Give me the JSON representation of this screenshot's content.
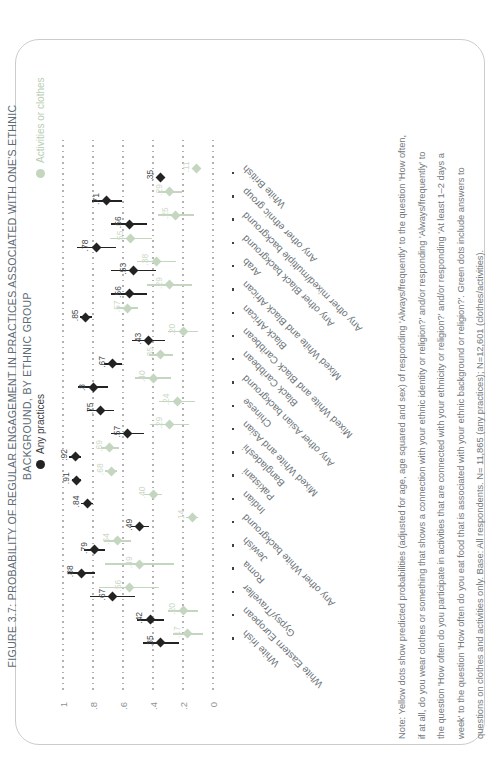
{
  "title": {
    "line1": "FIGURE 3.7: PROBABILITY OF REGULAR ENGAGEMENT IN PRACTICES ASSOCIATED WITH ONE'S ETHNIC",
    "line2": "BACKGROUND, BY ETHNIC GROUP"
  },
  "legend": {
    "any_practices": "Any practices",
    "activities_or_clothes": "Activities or clothes"
  },
  "colors": {
    "black_series": "#232323",
    "green_series": "#c4d6bf",
    "green_label": "#ccd9c6",
    "grid_dot": "#b2b2b2",
    "title": "#5d6b76",
    "note": "#72777b"
  },
  "chart_data": {
    "type": "scatter",
    "title": "FIGURE 3.7: PROBABILITY OF REGULAR ENGAGEMENT IN PRACTICES ASSOCIATED WITH ONE'S ETHNIC BACKGROUND, BY ETHNIC GROUP",
    "ylabel": "",
    "ylim": [
      0,
      1
    ],
    "yticks": [
      {
        "label": "1",
        "v": 1
      },
      {
        "label": ".8",
        "v": 0.8
      },
      {
        "label": ".6",
        "v": 0.6
      },
      {
        "label": ".4",
        "v": 0.4
      },
      {
        "label": ".2",
        "v": 0.2
      },
      {
        "label": "0",
        "v": 0
      }
    ],
    "grid": "dotted",
    "legend_position": "top",
    "categories": [
      "White Irish",
      "White Eastern European",
      "Gypsy/Traveller",
      "Roma",
      "Jewish",
      "Any other White background",
      "Indian",
      "Pakistani",
      "Bangladeshi",
      "Mixed White and Asian",
      "Chinese",
      "Any other Asian background",
      "Black Caribbean",
      "Mixed White and Black Caribbean",
      "Black African",
      "Mixed White and Black African",
      "Arab",
      "Any other Black background",
      "Any other mixed/multiple background",
      "Any other ethnic group",
      "White British"
    ],
    "series": [
      {
        "name": "Any practices",
        "marker": "diamond",
        "values": [
          0.35,
          0.42,
          0.67,
          0.88,
          0.79,
          0.49,
          0.84,
          0.91,
          0.92,
          0.57,
          0.75,
          0.8,
          0.67,
          0.43,
          0.85,
          0.56,
          0.53,
          0.78,
          0.56,
          0.71,
          0.35
        ],
        "labels": [
          ".35",
          ".42",
          ".67",
          ".88",
          ".79",
          ".49",
          ".84",
          ".91",
          ".92",
          ".57",
          ".75",
          ".8",
          ".67",
          ".43",
          ".85",
          ".56",
          ".53",
          ".78",
          ".56",
          ".71",
          ".35"
        ],
        "ci_half_width": [
          0.12,
          0.09,
          0.15,
          0.09,
          0.07,
          0.06,
          0.04,
          0.03,
          0.04,
          0.11,
          0.09,
          0.1,
          0.06,
          0.11,
          0.04,
          0.12,
          0.15,
          0.13,
          0.12,
          0.1,
          0.015
        ]
      },
      {
        "name": "Activities or clothes",
        "marker": "diamond",
        "values": [
          0.17,
          0.2,
          0.56,
          0.49,
          0.64,
          0.14,
          0.4,
          0.68,
          0.69,
          0.29,
          0.24,
          0.4,
          0.35,
          0.2,
          0.57,
          0.29,
          0.38,
          0.55,
          0.25,
          0.29,
          0.11
        ],
        "labels": [
          ".17",
          ".20",
          ".56",
          ".49",
          ".64",
          ".14",
          ".40",
          ".68",
          ".69",
          ".29",
          ".24",
          ".40",
          ".35",
          ".20",
          ".57",
          ".29",
          ".38",
          ".55",
          ".25",
          ".29",
          ".11"
        ],
        "ci_half_width": [
          0.1,
          0.1,
          0.2,
          0.23,
          0.09,
          0.04,
          0.06,
          0.04,
          0.06,
          0.13,
          0.12,
          0.12,
          0.08,
          0.1,
          0.07,
          0.15,
          0.13,
          0.14,
          0.12,
          0.08,
          0.015
        ]
      }
    ]
  },
  "note": {
    "lines": [
      "Note: Yellow dots show predicted probabilities (adjusted for age, age squared and sex) of responding 'Always/frequently' to the question 'How often,",
      "if at all, do you wear clothes or something that shows a connection with your ethnic identity or religion?' and/or responding 'Always/frequently' to",
      "the question 'How often do you participate in activities that are connected with your ethnicity or religion?' and/or responding 'At least 1–2 days a",
      "week' to the question 'How often do you eat food that is associated with your ethnic background or religion?'. Green dots include answers to",
      "questions on clothes and activities only. Base: All respondents. N= 11,865 (any practices); N=12,601 (clothes/activities)."
    ]
  }
}
